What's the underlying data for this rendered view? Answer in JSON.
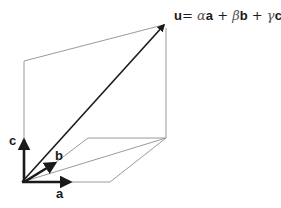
{
  "equation": {
    "lhs": "u",
    "eq": "=",
    "alpha": "α",
    "a": "a",
    "plus1": "+",
    "beta": "β",
    "b": "b",
    "plus2": "+",
    "gamma": "γ",
    "c": "c"
  },
  "labels": {
    "a": "a",
    "b": "b",
    "c": "c"
  },
  "colors": {
    "vector": "#1a1a1a",
    "guide": "#9a9a9a"
  }
}
